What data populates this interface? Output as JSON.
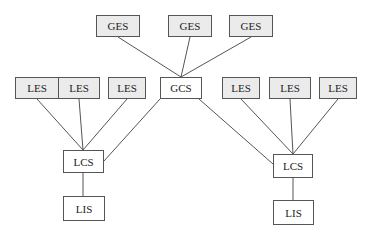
{
  "diagram": {
    "type": "hierarchy",
    "nodes": [
      {
        "id": "ges1",
        "label": "GES",
        "x": 96,
        "y": 15,
        "w": 44,
        "h": 22,
        "shaded": true
      },
      {
        "id": "ges2",
        "label": "GES",
        "x": 168,
        "y": 15,
        "w": 44,
        "h": 22,
        "shaded": true
      },
      {
        "id": "ges3",
        "label": "GES",
        "x": 229,
        "y": 15,
        "w": 44,
        "h": 22,
        "shaded": true
      },
      {
        "id": "les1",
        "label": "LES",
        "x": 15,
        "y": 77,
        "w": 44,
        "h": 22,
        "shaded": true
      },
      {
        "id": "les2",
        "label": "LES",
        "x": 58,
        "y": 77,
        "w": 42,
        "h": 22,
        "shaded": true
      },
      {
        "id": "les3",
        "label": "LES",
        "x": 108,
        "y": 77,
        "w": 38,
        "h": 22,
        "shaded": true
      },
      {
        "id": "gcs",
        "label": "GCS",
        "x": 160,
        "y": 77,
        "w": 42,
        "h": 22,
        "shaded": false
      },
      {
        "id": "les4",
        "label": "LES",
        "x": 222,
        "y": 77,
        "w": 38,
        "h": 22,
        "shaded": true
      },
      {
        "id": "les5",
        "label": "LES",
        "x": 269,
        "y": 77,
        "w": 42,
        "h": 22,
        "shaded": true
      },
      {
        "id": "les6",
        "label": "LES",
        "x": 319,
        "y": 77,
        "w": 38,
        "h": 22,
        "shaded": true
      },
      {
        "id": "lcs1",
        "label": "LCS",
        "x": 63,
        "y": 150,
        "w": 41,
        "h": 23,
        "shaded": false
      },
      {
        "id": "lis1",
        "label": "LIS",
        "x": 63,
        "y": 196,
        "w": 42,
        "h": 25,
        "shaded": false
      },
      {
        "id": "lcs2",
        "label": "LCS",
        "x": 273,
        "y": 154,
        "w": 40,
        "h": 24,
        "shaded": false
      },
      {
        "id": "lis2",
        "label": "LIS",
        "x": 273,
        "y": 200,
        "w": 41,
        "h": 25,
        "shaded": false
      }
    ],
    "edges": [
      {
        "from": "ges1",
        "to": "gcs",
        "x1": 118,
        "y1": 37,
        "x2": 181,
        "y2": 77
      },
      {
        "from": "ges2",
        "to": "gcs",
        "x1": 190,
        "y1": 37,
        "x2": 181,
        "y2": 77
      },
      {
        "from": "ges3",
        "to": "gcs",
        "x1": 251,
        "y1": 37,
        "x2": 181,
        "y2": 77
      },
      {
        "from": "les1",
        "to": "lcs1",
        "x1": 37,
        "y1": 99,
        "x2": 83,
        "y2": 150
      },
      {
        "from": "les2",
        "to": "lcs1",
        "x1": 79,
        "y1": 99,
        "x2": 83,
        "y2": 150
      },
      {
        "from": "les3",
        "to": "lcs1",
        "x1": 127,
        "y1": 99,
        "x2": 83,
        "y2": 150
      },
      {
        "from": "gcs",
        "to": "lcs1",
        "x1": 160,
        "y1": 99,
        "x2": 104,
        "y2": 161
      },
      {
        "from": "gcs",
        "to": "lcs2",
        "x1": 199,
        "y1": 99,
        "x2": 273,
        "y2": 164
      },
      {
        "from": "les4",
        "to": "lcs2",
        "x1": 241,
        "y1": 99,
        "x2": 293,
        "y2": 154
      },
      {
        "from": "les5",
        "to": "lcs2",
        "x1": 290,
        "y1": 99,
        "x2": 293,
        "y2": 154
      },
      {
        "from": "les6",
        "to": "lcs2",
        "x1": 338,
        "y1": 99,
        "x2": 293,
        "y2": 154
      },
      {
        "from": "lcs1",
        "to": "lis1",
        "x1": 83,
        "y1": 173,
        "x2": 83,
        "y2": 196
      },
      {
        "from": "lcs2",
        "to": "lis2",
        "x1": 293,
        "y1": 178,
        "x2": 293,
        "y2": 200
      }
    ],
    "colors": {
      "shaded_fill": "#ebebeb",
      "plain_fill": "#ffffff",
      "border": "#555555",
      "line": "#555555",
      "text": "#222222"
    }
  }
}
